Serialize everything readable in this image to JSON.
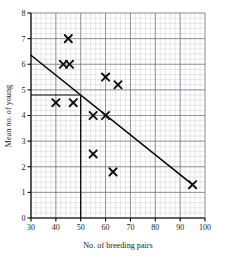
{
  "chart_data": {
    "type": "scatter",
    "title": "",
    "xlabel": "No. of breeding pairs",
    "ylabel": "Mean no. of young",
    "xlim": [
      30,
      100
    ],
    "ylim": [
      0,
      8
    ],
    "xticks": [
      30,
      40,
      50,
      60,
      70,
      80,
      90,
      100
    ],
    "yticks": [
      0,
      1,
      2,
      3,
      4,
      5,
      6,
      7,
      8
    ],
    "xtick_labels": [
      "30",
      "40",
      "50",
      "60",
      "70",
      "80",
      "90",
      "100"
    ],
    "ytick_labels": [
      "0",
      "1",
      "2",
      "3",
      "4",
      "5",
      "6",
      "7",
      "8"
    ],
    "x_major_step": 10,
    "x_minor_step": 2,
    "y_major_step": 1,
    "y_minor_step": 0.2,
    "grid": true,
    "legend": "none",
    "marker": "x-cross",
    "points": [
      {
        "x": 45,
        "y": 7.0
      },
      {
        "x": 43,
        "y": 6.0
      },
      {
        "x": 45.5,
        "y": 6.0
      },
      {
        "x": 40,
        "y": 4.5
      },
      {
        "x": 47,
        "y": 4.5
      },
      {
        "x": 55,
        "y": 4.0
      },
      {
        "x": 60,
        "y": 4.0
      },
      {
        "x": 60,
        "y": 5.5
      },
      {
        "x": 65,
        "y": 5.2
      },
      {
        "x": 55,
        "y": 2.5
      },
      {
        "x": 63,
        "y": 1.8
      },
      {
        "x": 95,
        "y": 1.3
      }
    ],
    "series": [
      {
        "name": "data",
        "x": [
          45,
          43,
          45.5,
          40,
          47,
          55,
          60,
          60,
          65,
          55,
          63,
          95
        ],
        "values": [
          7.0,
          6.0,
          6.0,
          4.5,
          4.5,
          4.0,
          4.0,
          5.5,
          5.2,
          2.5,
          1.8,
          1.3
        ]
      }
    ],
    "trend_line": {
      "name": "line-of-best-fit",
      "x_start": 30,
      "y_start": 6.35,
      "x_end": 95,
      "y_end": 1.3
    },
    "construction_lines": {
      "name": "reading-off-construction",
      "vertical_x": 50,
      "horizontal_y": 4.8,
      "description": "vertical from x=50 up to the line, horizontal across to y-axis at 4.8"
    },
    "colors": {
      "marker": "#111111",
      "trend": "#000000",
      "minor_grid": "#b9b9c4",
      "major_grid": "#6e6e7d",
      "axis": "#000000",
      "background": "#ffffff"
    }
  }
}
